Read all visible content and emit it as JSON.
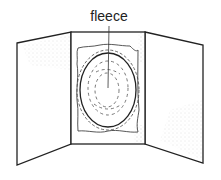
{
  "diagram": {
    "labels": {
      "fleece": "fleece"
    },
    "colors": {
      "line": "#222222",
      "stipple": "#9a9a9a",
      "background": "#ffffff"
    }
  }
}
